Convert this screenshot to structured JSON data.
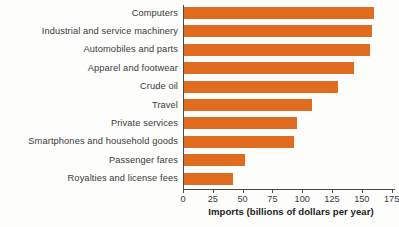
{
  "chart_data": {
    "type": "bar",
    "orientation": "horizontal",
    "title": "",
    "subtitle": "",
    "xlabel": "Imports (billions of dollars per year)",
    "ylabel": "",
    "xlim": [
      0,
      180
    ],
    "xticks": [
      0,
      25,
      50,
      75,
      100,
      125,
      150,
      175
    ],
    "xtick_labels": [
      "0",
      "25",
      "50",
      "75",
      "100",
      "125",
      "150",
      "175"
    ],
    "grid": false,
    "legend": null,
    "categories": [
      "Computers",
      "Industrial and service machinery",
      "Automobiles and parts",
      "Apparel and footwear",
      "Crude oil",
      "Travel",
      "Private services",
      "Smartphones and household goods",
      "Passenger fares",
      "Royalties and license fees"
    ],
    "values": [
      159,
      158,
      156,
      143,
      129,
      107,
      95,
      92,
      51,
      41
    ],
    "bar_color": "#e06c20",
    "axis_color": "#4a4a4a",
    "text_color": "#3b3b3b",
    "background_color": "#fdfdfc"
  }
}
